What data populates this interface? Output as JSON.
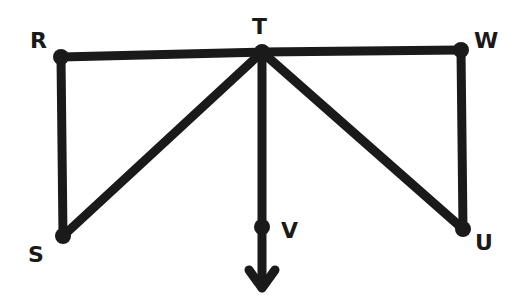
{
  "diagram": {
    "type": "graph",
    "line_color": "#1a1a1a",
    "background": "#ffffff",
    "nodes": [
      {
        "id": "R",
        "label": "R",
        "x": 61,
        "y": 57,
        "label_x": 30,
        "label_y": 30
      },
      {
        "id": "T",
        "label": "T",
        "x": 262,
        "y": 52,
        "label_x": 252,
        "label_y": 16
      },
      {
        "id": "W",
        "label": "W",
        "x": 461,
        "y": 50,
        "label_x": 474,
        "label_y": 30
      },
      {
        "id": "S",
        "label": "S",
        "x": 63,
        "y": 236,
        "label_x": 28,
        "label_y": 244
      },
      {
        "id": "V",
        "label": "V",
        "x": 262,
        "y": 227,
        "label_x": 281,
        "label_y": 220
      },
      {
        "id": "U",
        "label": "U",
        "x": 463,
        "y": 229,
        "label_x": 475,
        "label_y": 232
      }
    ],
    "edges": [
      {
        "from": "R",
        "to": "T"
      },
      {
        "from": "T",
        "to": "W"
      },
      {
        "from": "R",
        "to": "S"
      },
      {
        "from": "T",
        "to": "S"
      },
      {
        "from": "T",
        "to": "V"
      },
      {
        "from": "T",
        "to": "U"
      },
      {
        "from": "W",
        "to": "U"
      }
    ],
    "arrow": {
      "from": "V",
      "direction": "down",
      "tip_x": 262,
      "tip_y": 288
    }
  }
}
